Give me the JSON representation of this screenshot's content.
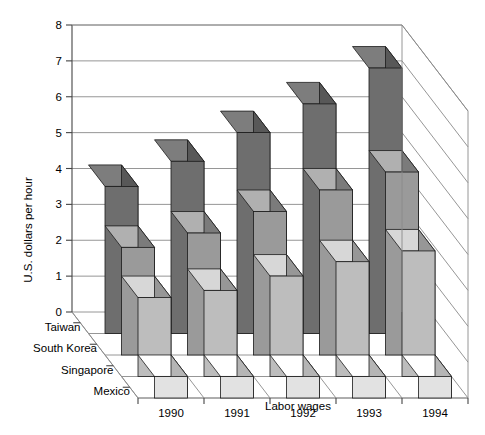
{
  "chart_data": {
    "type": "bar",
    "title": "",
    "subtitle": "",
    "xlabel": "Labor wages",
    "ylabel": "U.S. dollars per hour",
    "categories": [
      "1990",
      "1991",
      "1992",
      "1993",
      "1994"
    ],
    "series": [
      {
        "name": "Taiwan",
        "color": "#6e6e6e",
        "values": [
          4.1,
          4.8,
          5.6,
          6.4,
          7.4
        ]
      },
      {
        "name": "South Korea",
        "color": "#9a9a9a",
        "values": [
          3.0,
          3.4,
          4.0,
          4.6,
          5.1
        ]
      },
      {
        "name": "Singapore",
        "color": "#bdbdbd",
        "values": [
          2.2,
          2.4,
          2.8,
          3.2,
          3.5
        ]
      },
      {
        "name": "Mexico",
        "color": "#e2e2e2",
        "values": [
          0.6,
          0.6,
          0.6,
          0.6,
          0.6
        ]
      }
    ],
    "ylim": [
      0,
      8
    ],
    "yticks": [
      0,
      1,
      2,
      3,
      4,
      5,
      6,
      7,
      8
    ],
    "ytick_labels": [
      "0",
      "1",
      "2",
      "3",
      "4",
      "5",
      "6",
      "7",
      "8"
    ],
    "grid": true,
    "legend_position": "depth-axis-left",
    "projection": "3d-isometric",
    "colors": {
      "background": "#ffffff",
      "gridline": "#8a8a8a",
      "axis": "#444444",
      "bar_outline": "#1a1a1a"
    }
  },
  "axis": {
    "y_title": "U.S. dollars per hour",
    "x_title": "Labor wages"
  }
}
